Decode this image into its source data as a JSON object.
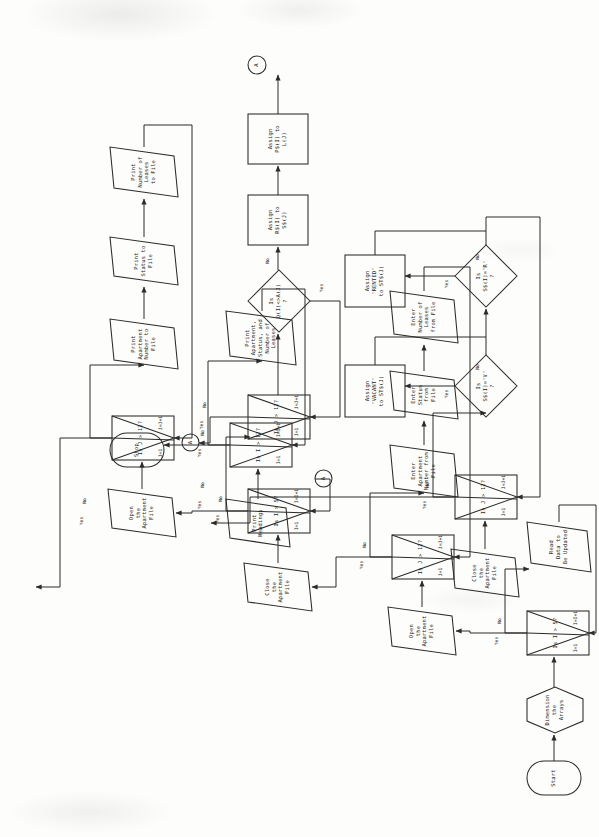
{
  "document": {
    "kind": "flowchart",
    "orientation": "printed-sideways-rotated-90-ccw",
    "ink_color": "#2b2b2b",
    "paper_color": "#fdfdfb"
  },
  "chart_data": {
    "type": "diagram",
    "nodes": [
      {
        "id": "start",
        "shape": "terminal",
        "text": "Start"
      },
      {
        "id": "dim",
        "shape": "preparation",
        "text": "Dimension\nthe\nArrays"
      },
      {
        "id": "loopA",
        "shape": "loop",
        "text": "Is I > 5?",
        "init": "I=1",
        "step": "I=I+1"
      },
      {
        "id": "readdata",
        "shape": "io",
        "text": "Read\nData to\nBe Updated"
      },
      {
        "id": "open1",
        "shape": "io",
        "text": "Open\nthe\nApartment\nFile"
      },
      {
        "id": "loopB",
        "shape": "loop",
        "text": "Is J > 12?",
        "init": "J=1",
        "step": "J=J+1"
      },
      {
        "id": "entapt",
        "shape": "io",
        "text": "Enter\nApartment\nNumber from\nFile"
      },
      {
        "id": "entstat",
        "shape": "io",
        "text": "Enter\nStatus\nfrom\nFile"
      },
      {
        "id": "entlease",
        "shape": "io",
        "text": "Enter\nNumber of\nLeases\nfrom File"
      },
      {
        "id": "close1",
        "shape": "io",
        "text": "Close\nthe\nApartment\nFile"
      },
      {
        "id": "loopC",
        "shape": "loop",
        "text": "Is I > 5?",
        "init": "I=1",
        "step": "I=I+1"
      },
      {
        "id": "loopD",
        "shape": "loop",
        "text": "Is J > 12?",
        "init": "J=1",
        "step": "J=J+1"
      },
      {
        "id": "cmpdec",
        "shape": "decision",
        "text": "Is\nQ(I)<>A(J)\n?"
      },
      {
        "id": "assignRS",
        "shape": "process",
        "text": "Assign\nR$(I) to\nS$(J)"
      },
      {
        "id": "assignPS",
        "shape": "process",
        "text": "Assign\nP$(I) to\nL(J)"
      },
      {
        "id": "connA1",
        "shape": "connector",
        "text": "A"
      },
      {
        "id": "connA2",
        "shape": "connector",
        "text": "A"
      },
      {
        "id": "connA3",
        "shape": "connector",
        "text": "A"
      },
      {
        "id": "open2",
        "shape": "io",
        "text": "Open\nthe\nApartment\nFile"
      },
      {
        "id": "loopE",
        "shape": "loop",
        "text": "Is J > 12?",
        "init": "J=1",
        "step": "J=J+1"
      },
      {
        "id": "prtapt",
        "shape": "io",
        "text": "Print\nApartment\nNumber to\nFile"
      },
      {
        "id": "prtstat",
        "shape": "io",
        "text": "Print\nStatus to\nFile"
      },
      {
        "id": "prtlease",
        "shape": "io",
        "text": "Print\nNumber of\nLeases\nto File"
      },
      {
        "id": "close2",
        "shape": "io",
        "text": "Close\nthe\nApartment\nFile"
      },
      {
        "id": "loopF",
        "shape": "loop",
        "text": "Is J > 12?",
        "init": "J=1",
        "step": "J=J+1"
      },
      {
        "id": "decV",
        "shape": "decision",
        "text": "Is\nS$(I)=\"V\"\n?"
      },
      {
        "id": "decR",
        "shape": "decision",
        "text": "Is\nS$(I)=\"R\"\n?"
      },
      {
        "id": "asgVAC",
        "shape": "process",
        "text": "Assign\n\"VACANT\"\nto ST$(J)"
      },
      {
        "id": "asgRENT",
        "shape": "process",
        "text": "Assign\n\"RENTED\"\nto ST$(J)"
      },
      {
        "id": "prthead",
        "shape": "io",
        "text": "Print\nHeadings"
      },
      {
        "id": "loopG",
        "shape": "loop",
        "text": "Is I > 12?",
        "init": "I=1",
        "step": "I=I+1"
      },
      {
        "id": "prtrep",
        "shape": "io",
        "text": "Print\nApartment,\nStatus, and\nNumber of\nLeases"
      },
      {
        "id": "stop",
        "shape": "terminal",
        "text": "Stop"
      }
    ],
    "edge_labels": {
      "yes": "Yes",
      "no": "No"
    },
    "edges": [
      {
        "from": "start",
        "to": "dim",
        "label": ""
      },
      {
        "from": "dim",
        "to": "loopA",
        "label": ""
      },
      {
        "from": "loopA",
        "to": "open1",
        "label": "Yes"
      },
      {
        "from": "loopA",
        "to": "readdata",
        "label": "No"
      },
      {
        "from": "readdata",
        "to": "loopA",
        "label": ""
      },
      {
        "from": "open1",
        "to": "loopB",
        "label": ""
      },
      {
        "from": "loopB",
        "to": "close1",
        "label": "Yes"
      },
      {
        "from": "loopB",
        "to": "entapt",
        "label": "No"
      },
      {
        "from": "entapt",
        "to": "entstat",
        "label": ""
      },
      {
        "from": "entstat",
        "to": "entlease",
        "label": ""
      },
      {
        "from": "entlease",
        "to": "loopB",
        "label": ""
      },
      {
        "from": "close1",
        "to": "loopC",
        "label": ""
      },
      {
        "from": "loopC",
        "to": "open2",
        "label": "Yes"
      },
      {
        "from": "loopC",
        "to": "loopD",
        "label": "No"
      },
      {
        "from": "loopD",
        "to": "connA1",
        "label": "Yes"
      },
      {
        "from": "loopD",
        "to": "cmpdec",
        "label": "No"
      },
      {
        "from": "cmpdec",
        "to": "loopD",
        "label": "Yes"
      },
      {
        "from": "cmpdec",
        "to": "assignRS",
        "label": "No"
      },
      {
        "from": "assignRS",
        "to": "assignPS",
        "label": ""
      },
      {
        "from": "assignPS",
        "to": "connA3",
        "label": ""
      },
      {
        "from": "connA2",
        "to": "loopC",
        "label": ""
      },
      {
        "from": "open2",
        "to": "loopE",
        "label": ""
      },
      {
        "from": "loopE",
        "to": "close2",
        "label": "Yes"
      },
      {
        "from": "loopE",
        "to": "prtapt",
        "label": "No"
      },
      {
        "from": "prtapt",
        "to": "prtstat",
        "label": ""
      },
      {
        "from": "prtstat",
        "to": "prtlease",
        "label": ""
      },
      {
        "from": "prtlease",
        "to": "loopE",
        "label": ""
      },
      {
        "from": "close2",
        "to": "loopF",
        "label": ""
      },
      {
        "from": "loopF",
        "to": "prthead",
        "label": "Yes"
      },
      {
        "from": "loopF",
        "to": "decV",
        "label": "No"
      },
      {
        "from": "decV",
        "to": "asgVAC",
        "label": "Yes"
      },
      {
        "from": "decV",
        "to": "decR",
        "label": "No"
      },
      {
        "from": "decR",
        "to": "asgRENT",
        "label": "Yes"
      },
      {
        "from": "decR",
        "to": "loopF",
        "label": "No"
      },
      {
        "from": "asgVAC",
        "to": "loopF",
        "label": ""
      },
      {
        "from": "asgRENT",
        "to": "loopF",
        "label": ""
      },
      {
        "from": "prthead",
        "to": "loopG",
        "label": ""
      },
      {
        "from": "loopG",
        "to": "stop",
        "label": "Yes"
      },
      {
        "from": "loopG",
        "to": "prtrep",
        "label": "No"
      },
      {
        "from": "prtrep",
        "to": "loopG",
        "label": ""
      }
    ]
  }
}
